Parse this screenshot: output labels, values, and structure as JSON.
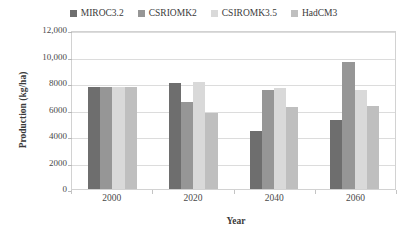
{
  "chart_data": {
    "type": "bar",
    "title": "",
    "xlabel": "Year",
    "ylabel": "Production (kg/ha)",
    "categories": [
      "2000",
      "2020",
      "2040",
      "2060"
    ],
    "ylim": [
      0,
      12000
    ],
    "ytick_values": [
      0,
      2000,
      4000,
      6000,
      8000,
      10000,
      12000
    ],
    "ytick_labels": [
      "0",
      "2000",
      "4000",
      "6000",
      "8000",
      "10,000",
      "12,000"
    ],
    "grid": true,
    "legend_position": "top-center",
    "series": [
      {
        "name": "MIROC3.2",
        "color": "#6e6e6e",
        "values": [
          7700,
          8000,
          4350,
          5200
        ]
      },
      {
        "name": "CSRIOMK2",
        "color": "#969696",
        "values": [
          7700,
          6600,
          7500,
          9550
        ]
      },
      {
        "name": "CSIROMK3.5",
        "color": "#d9d9d9",
        "values": [
          7700,
          8100,
          7600,
          7500
        ]
      },
      {
        "name": "HadCM3",
        "color": "#bfbfbf",
        "values": [
          7700,
          5700,
          6200,
          6250
        ]
      }
    ]
  }
}
